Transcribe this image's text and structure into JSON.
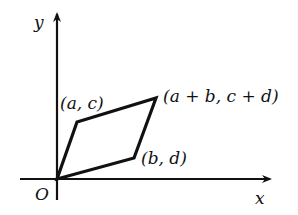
{
  "diagram": {
    "title": "",
    "axes": {
      "x_label": "x",
      "y_label": "y",
      "origin_label": "O"
    },
    "shape": "parallelogram",
    "vertices": [
      {
        "id": "origin",
        "label": "O"
      },
      {
        "id": "ac",
        "label": "(a, c)"
      },
      {
        "id": "abcd",
        "label": "(a + b, c + d)"
      },
      {
        "id": "bd",
        "label": "(b, d)"
      }
    ],
    "colors": {
      "stroke": "#111111",
      "background": "#ffffff"
    }
  }
}
